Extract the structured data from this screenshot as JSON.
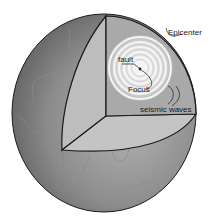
{
  "diagram": {
    "labels": {
      "epicenter": "Epicenter",
      "fault": "fault",
      "focus": "Focus",
      "seismic_waves": "seismic waves"
    },
    "colors": {
      "outline": "#1a1a1a",
      "surface_dark": "#6e6e6e",
      "surface_light": "#a8a8a8",
      "cut_face_left": "#bdbdbd",
      "cut_face_back": "#a9a9a9",
      "cut_face_bottom": "#c4c4c4",
      "wave_ring": "#f2f2f2",
      "continent_line": "#8a8a8a"
    }
  }
}
